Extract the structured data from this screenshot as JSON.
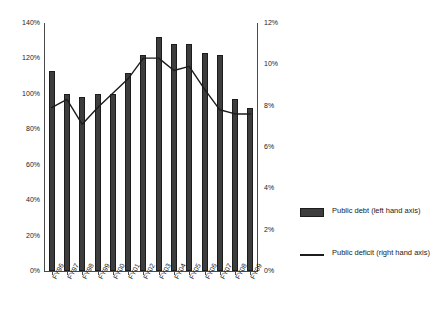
{
  "chart_data": {
    "type": "bar",
    "title": "",
    "xlabel": "",
    "categories": [
      "FY96",
      "FY97",
      "FY98",
      "FY99",
      "FY00",
      "FY01",
      "FY02",
      "FY03",
      "FY04",
      "FY05",
      "FY06",
      "FY07",
      "FY08",
      "FY09"
    ],
    "series": [
      {
        "name": "Public debt (left hand axis)",
        "type": "bar",
        "axis": "left",
        "unit": "%",
        "color": "#3d3d3d",
        "values": [
          113,
          100,
          98,
          100,
          100,
          112,
          122,
          132,
          128,
          128,
          123,
          122,
          97,
          92
        ]
      },
      {
        "name": "Public deficit (right hand axis)",
        "type": "line",
        "axis": "right",
        "unit": "%",
        "color": "#1c1c1c",
        "values": [
          7.9,
          8.3,
          7.1,
          7.9,
          8.6,
          9.3,
          10.3,
          10.3,
          9.7,
          9.9,
          8.8,
          7.8,
          7.6,
          7.6
        ]
      }
    ],
    "left_axis": {
      "label": "",
      "ylim": [
        0,
        140
      ],
      "tick_step": 20,
      "ticks": [
        "0%",
        "20%",
        "40%",
        "60%",
        "80%",
        "100%",
        "120%",
        "140%"
      ],
      "tick_values": [
        0,
        20,
        40,
        60,
        80,
        100,
        120,
        140
      ]
    },
    "right_axis": {
      "label": "",
      "ylim": [
        0,
        12
      ],
      "tick_step": 2,
      "ticks": [
        "0%",
        "2%",
        "4%",
        "6%",
        "8%",
        "10%",
        "12%"
      ],
      "tick_values": [
        0,
        2,
        4,
        6,
        8,
        10,
        12
      ]
    },
    "grid": false,
    "legend_position": "right"
  },
  "legend": {
    "items": [
      {
        "label": "Public debt (left hand axis)",
        "marker": "bar-swatch"
      },
      {
        "label": "Public deficit (right hand axis)",
        "marker": "line-swatch"
      }
    ]
  }
}
